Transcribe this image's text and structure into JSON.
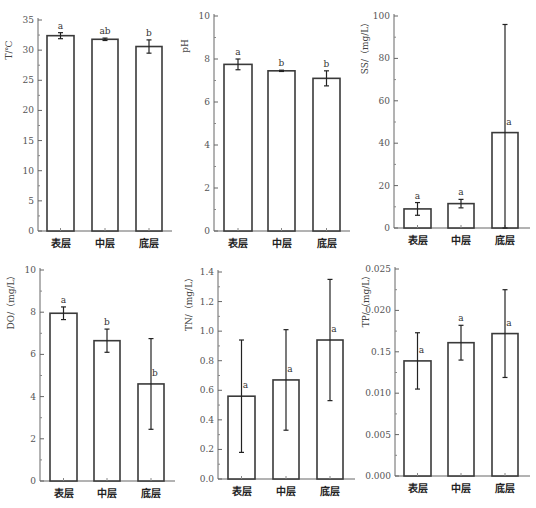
{
  "figure": {
    "categories": [
      "表层",
      "中层",
      "底层"
    ]
  },
  "chart_data": [
    {
      "type": "bar",
      "title": "",
      "ylabel": "T/℃",
      "xlabel": "",
      "categories": [
        "表层",
        "中层",
        "底层"
      ],
      "values": [
        32.4,
        31.8,
        30.6
      ],
      "errors": [
        0.5,
        0.2,
        1.1
      ],
      "significance": [
        "a",
        "ab",
        "b"
      ],
      "ylim": [
        0,
        35
      ],
      "yticks": [
        0,
        5,
        10,
        15,
        20,
        25,
        30,
        35
      ],
      "ytick_labels": [
        "0",
        "5",
        "10",
        "15",
        "20",
        "25",
        "30",
        "35"
      ],
      "grid": false,
      "layout": {
        "left": 38,
        "top": 20,
        "bottom": 231,
        "right": 172,
        "bars": [
          [
            47,
            74
          ],
          [
            92,
            118
          ],
          [
            136,
            162
          ]
        ]
      }
    },
    {
      "type": "bar",
      "title": "",
      "ylabel": "pH",
      "xlabel": "",
      "categories": [
        "表层",
        "中层",
        "底层"
      ],
      "values": [
        7.75,
        7.45,
        7.1
      ],
      "errors": [
        0.25,
        0.03,
        0.35
      ],
      "significance": [
        "a",
        "b",
        "b"
      ],
      "ylim": [
        0,
        10
      ],
      "yticks": [
        0,
        2,
        4,
        6,
        8,
        10
      ],
      "ytick_labels": [
        "0",
        "2",
        "4",
        "6",
        "8",
        "10"
      ],
      "grid": false,
      "layout": {
        "left": 214,
        "top": 16,
        "bottom": 231,
        "right": 350,
        "bars": [
          [
            224,
            252
          ],
          [
            268,
            295
          ],
          [
            313,
            340
          ]
        ]
      }
    },
    {
      "type": "bar",
      "title": "",
      "ylabel": "SS/（mg/L）",
      "xlabel": "",
      "categories": [
        "表层",
        "中层",
        "底层"
      ],
      "values": [
        9,
        11.5,
        45
      ],
      "errors": [
        3,
        2,
        51
      ],
      "significance": [
        "a",
        "a",
        "a"
      ],
      "ylim": [
        0,
        100
      ],
      "yticks": [
        0,
        20,
        40,
        60,
        80,
        100
      ],
      "ytick_labels": [
        "0",
        "20",
        "40",
        "60",
        "80",
        "100"
      ],
      "grid": false,
      "layout": {
        "left": 394,
        "top": 16,
        "bottom": 228,
        "right": 530,
        "bars": [
          [
            404,
            431
          ],
          [
            448,
            474
          ],
          [
            492,
            518
          ]
        ]
      }
    },
    {
      "type": "bar",
      "title": "",
      "ylabel": "DO/（mg/L）",
      "xlabel": "",
      "categories": [
        "表层",
        "中层",
        "底层"
      ],
      "values": [
        7.95,
        6.65,
        4.6
      ],
      "errors": [
        0.3,
        0.55,
        2.15
      ],
      "significance": [
        "a",
        "b",
        "b"
      ],
      "ylim": [
        0,
        10
      ],
      "yticks": [
        0,
        2,
        4,
        6,
        8,
        10
      ],
      "ytick_labels": [
        "0",
        "2",
        "4",
        "6",
        "8",
        "10"
      ],
      "grid": false,
      "layout": {
        "left": 40,
        "top": 270,
        "bottom": 481,
        "right": 175,
        "bars": [
          [
            50,
            77
          ],
          [
            94,
            120
          ],
          [
            138,
            164
          ]
        ]
      }
    },
    {
      "type": "bar",
      "title": "",
      "ylabel": "TN/（mg/L）",
      "xlabel": "",
      "categories": [
        "表层",
        "中层",
        "底层"
      ],
      "values": [
        0.56,
        0.67,
        0.94
      ],
      "errors": [
        0.38,
        0.34,
        0.41
      ],
      "significance": [
        "a",
        "a",
        "a"
      ],
      "ylim": [
        0,
        1.5
      ],
      "yticks": [
        0.0,
        0.2,
        0.4,
        0.6,
        0.8,
        1.0,
        1.2,
        1.4
      ],
      "ytick_labels": [
        "0.0",
        "0.2",
        "0.4",
        "0.6",
        "0.8",
        "1.0",
        "1.2",
        "1.4"
      ],
      "grid": false,
      "layout": {
        "left": 218,
        "top": 272,
        "bottom": 479,
        "right": 355,
        "bars": [
          [
            228,
            255
          ],
          [
            273,
            299
          ],
          [
            317,
            343
          ]
        ]
      }
    },
    {
      "type": "bar",
      "title": "",
      "ylabel": "TP/（mg/L）",
      "xlabel": "",
      "categories": [
        "表层",
        "中层",
        "底层"
      ],
      "values": [
        0.0139,
        0.0161,
        0.0172
      ],
      "errors": [
        0.0034,
        0.0021,
        0.0053
      ],
      "significance": [
        "a",
        "a",
        "a"
      ],
      "ylim": [
        0,
        0.025
      ],
      "yticks": [
        0.0,
        0.005,
        0.01,
        0.015,
        0.02,
        0.025
      ],
      "ytick_labels": [
        "0.000",
        "0.005",
        "0.010",
        "0.15",
        "0.020",
        "0.025"
      ],
      "grid": false,
      "layout": {
        "left": 395,
        "top": 269,
        "bottom": 476,
        "right": 530,
        "bars": [
          [
            404,
            431
          ],
          [
            448,
            474
          ],
          [
            492,
            518
          ]
        ]
      }
    }
  ]
}
